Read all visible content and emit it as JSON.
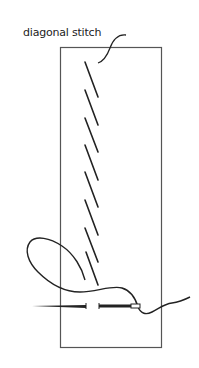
{
  "figure": {
    "label": "diagonal stitch",
    "colors": {
      "line": "#222222",
      "frame": "#555555",
      "background": "#ffffff"
    },
    "fabric_frame": {
      "x": 60,
      "y": 47,
      "width": 101,
      "height": 300
    },
    "stitch_count": 8,
    "stitches": [
      {
        "x1": 85,
        "y1": 62,
        "x2": 98,
        "y2": 97
      },
      {
        "x1": 85,
        "y1": 90,
        "x2": 98,
        "y2": 125
      },
      {
        "x1": 85,
        "y1": 118,
        "x2": 98,
        "y2": 152
      },
      {
        "x1": 85,
        "y1": 145,
        "x2": 98,
        "y2": 180
      },
      {
        "x1": 85,
        "y1": 172,
        "x2": 98,
        "y2": 207
      },
      {
        "x1": 85,
        "y1": 200,
        "x2": 98,
        "y2": 235
      },
      {
        "x1": 85,
        "y1": 228,
        "x2": 98,
        "y2": 262
      },
      {
        "x1": 86,
        "y1": 252,
        "x2": 98,
        "y2": 285
      }
    ],
    "needle": {
      "y": 306,
      "x_start": 32,
      "x_end": 140
    }
  }
}
